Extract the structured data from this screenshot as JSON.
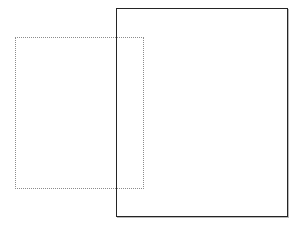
{
  "canvas": {
    "width": 306,
    "height": 229,
    "background_color": "#ffffff"
  },
  "shapes": [
    {
      "name": "dotted-selection-rectangle",
      "role": "selection-marquee",
      "style": "dotted",
      "stroke_color": "#8c8c8c",
      "stroke_width": 1,
      "fill": "none",
      "x": 15,
      "y": 37,
      "width": 129,
      "height": 152,
      "z_index": 1
    },
    {
      "name": "solid-page-rectangle",
      "role": "page-frame",
      "style": "solid",
      "stroke_color": "#242424",
      "stroke_width": 1.5,
      "fill": "none",
      "x": 116,
      "y": 8,
      "width": 172,
      "height": 209,
      "z_index": 2,
      "shadow_color": "#b9b9b9"
    }
  ],
  "overlap_region": {
    "name": "intersection-area",
    "x": 116,
    "y": 37,
    "width": 28,
    "height": 152
  }
}
